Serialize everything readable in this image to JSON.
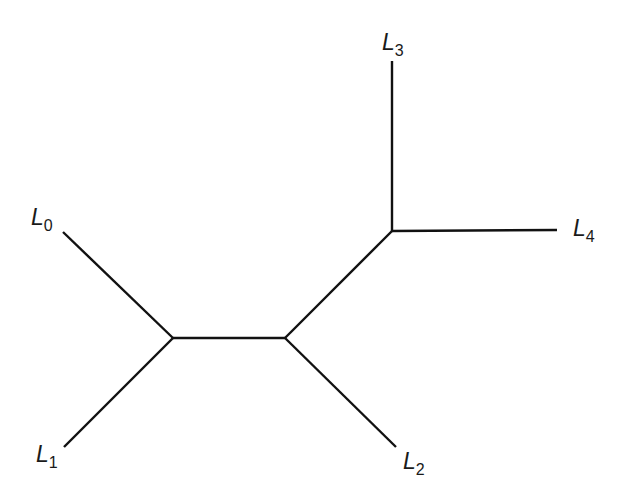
{
  "diagram": {
    "type": "unrooted-tree",
    "stroke_color": "#111111",
    "background": "#ffffff",
    "nodes": [
      {
        "id": "A",
        "x": 173,
        "y": 338
      },
      {
        "id": "B",
        "x": 285,
        "y": 338
      },
      {
        "id": "C",
        "x": 392,
        "y": 231
      }
    ],
    "leaves": [
      {
        "id": "L0",
        "base": "L",
        "sub": "0",
        "end": {
          "x": 63,
          "y": 232
        },
        "label_pos": {
          "x": 31,
          "y": 225
        },
        "parent": "A"
      },
      {
        "id": "L1",
        "base": "L",
        "sub": "1",
        "end": {
          "x": 64,
          "y": 447
        },
        "label_pos": {
          "x": 36,
          "y": 462
        },
        "parent": "A"
      },
      {
        "id": "L2",
        "base": "L",
        "sub": "2",
        "end": {
          "x": 396,
          "y": 447
        },
        "label_pos": {
          "x": 403,
          "y": 469
        },
        "parent": "B"
      },
      {
        "id": "L3",
        "base": "L",
        "sub": "3",
        "end": {
          "x": 392,
          "y": 61
        },
        "label_pos": {
          "x": 382,
          "y": 50
        },
        "parent": "C"
      },
      {
        "id": "L4",
        "base": "L",
        "sub": "4",
        "end": {
          "x": 557,
          "y": 230
        },
        "label_pos": {
          "x": 573,
          "y": 236
        },
        "parent": "C"
      }
    ],
    "internal_edges": [
      {
        "from": "A",
        "to": "B"
      },
      {
        "from": "B",
        "to": "C"
      }
    ]
  }
}
